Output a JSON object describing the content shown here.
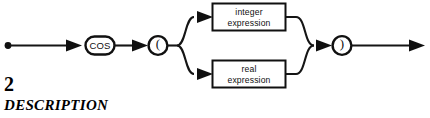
{
  "page": {
    "background_color": "#ffffff",
    "ink_color": "#101010"
  },
  "diagram": {
    "kind": "railroad-syntax-diagram",
    "start_marker": "start-dot",
    "end_marker": "end-arrow",
    "nodes": {
      "keyword": {
        "label": "COS",
        "shape": "rounded-oval"
      },
      "open_paren": {
        "label": "(",
        "shape": "circle"
      },
      "close_paren": {
        "label": ")",
        "shape": "circle"
      },
      "branch_top": {
        "line1": "integer",
        "line2": "expression",
        "shape": "rectangle"
      },
      "branch_bottom": {
        "line1": "real",
        "line2": "expression",
        "shape": "rectangle"
      }
    }
  },
  "caption": {
    "number": "2",
    "heading": "DESCRIPTION"
  }
}
